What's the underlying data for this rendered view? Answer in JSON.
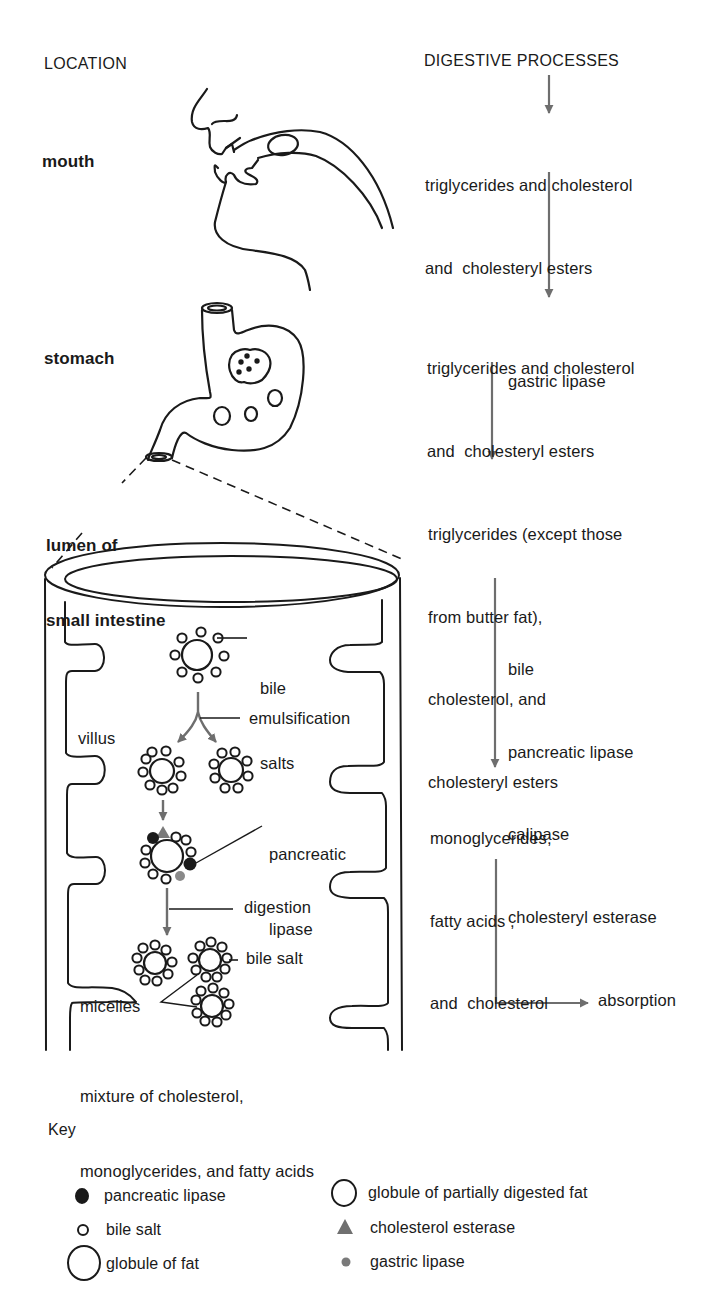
{
  "headers": {
    "location": "LOCATION",
    "processes": "DIGESTIVE PROCESSES"
  },
  "locations": {
    "mouth": "mouth",
    "stomach": "stomach",
    "intestine_line1": "lumen of",
    "intestine_line2": "small intestine"
  },
  "processes": {
    "step1": [
      "triglycerides and cholesterol",
      "and  cholesteryl esters"
    ],
    "step2": [
      "triglycerides and cholesterol",
      "and  cholesteryl esters"
    ],
    "enzyme2": "gastric lipase",
    "step3": [
      "triglycerides (except those",
      "from butter fat),",
      "cholesterol, and",
      "cholesteryl esters"
    ],
    "enzymes3": [
      "bile",
      "pancreatic lipase",
      "calipase",
      "cholesteryl esterase"
    ],
    "step4": [
      "monoglycerides,",
      "fatty acids ,",
      "and  cholesterol"
    ],
    "final": "absorption"
  },
  "intestine_labels": {
    "bile_salts": [
      "bile",
      "salts"
    ],
    "emulsification": "emulsification",
    "villus": "villus",
    "pancreatic_lipase": [
      "pancreatic",
      "lipase"
    ],
    "digestion": "digestion",
    "bile_salt": "bile salt",
    "micelles": "micelles",
    "mixture": [
      "mixture of cholesterol,",
      "monoglycerides, and fatty acids"
    ]
  },
  "key": {
    "title": "Key",
    "items": [
      {
        "symbol": "filled-black-dot",
        "label": "pancreatic lipase"
      },
      {
        "symbol": "small-open-circle",
        "label": "bile salt"
      },
      {
        "symbol": "large-open-circle",
        "label": "globule of fat"
      },
      {
        "symbol": "medium-open-circle",
        "label": "globule of partially digested fat"
      },
      {
        "symbol": "gray-triangle",
        "label": "cholesterol esterase"
      },
      {
        "symbol": "gray-dot",
        "label": "gastric lipase"
      }
    ]
  },
  "colors": {
    "ink": "#1a1a1a",
    "arrow_gray": "#6e6e6e",
    "gastric_lipase_gray": "#7a7a7a",
    "background": "#ffffff"
  }
}
